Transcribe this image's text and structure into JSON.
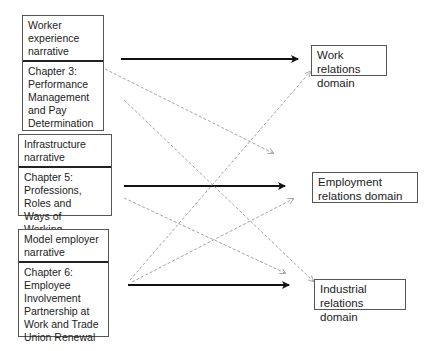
{
  "narratives": [
    {
      "title": "Worker experience narrative",
      "chapters": [
        "Chapter 3: Performance Management and Pay Determination",
        "Chapter 4: Flexibilities and Equalities"
      ]
    },
    {
      "title": "Infrastructure narrative",
      "chapters": [
        "Chapter 5: Professions, Roles and Ways of Working"
      ]
    },
    {
      "title": "Model employer narrative",
      "chapters": [
        "Chapter 6: Employee Involvement Partnership at Work and Trade Union Renewal"
      ]
    }
  ],
  "domains": [
    "Work relations domain",
    "Employment relations domain",
    "Industrial relations domain"
  ],
  "links": {
    "strong": [
      {
        "from": "Worker experience narrative",
        "to": "Work relations domain"
      },
      {
        "from": "Infrastructure narrative",
        "to": "Employment relations domain"
      },
      {
        "from": "Model employer narrative",
        "to": "Industrial relations domain"
      }
    ],
    "weak": [
      {
        "from": "Chapter 3",
        "to": "Employment relations domain"
      },
      {
        "from": "Chapter 4",
        "to": "Industrial relations domain"
      },
      {
        "from": "Chapter 5",
        "to": "Industrial relations domain"
      },
      {
        "from": "Chapter 6",
        "to": "Work relations domain"
      },
      {
        "from": "Chapter 6",
        "to": "Employment relations domain"
      }
    ]
  },
  "colors": {
    "strong": "#111111",
    "weak": "#999999",
    "border": "#555555"
  }
}
